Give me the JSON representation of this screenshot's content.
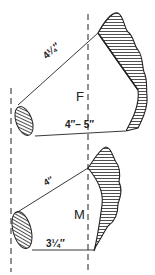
{
  "diagram": {
    "colors": {
      "ink": "#222222",
      "background": "#ffffff"
    },
    "figures": [
      {
        "id": "F",
        "label": "F",
        "upper_measure": "4¼″",
        "lower_measure": "4″– 5″"
      },
      {
        "id": "M",
        "label": "M",
        "upper_measure": "4″",
        "lower_measure": "3¼″"
      }
    ]
  }
}
